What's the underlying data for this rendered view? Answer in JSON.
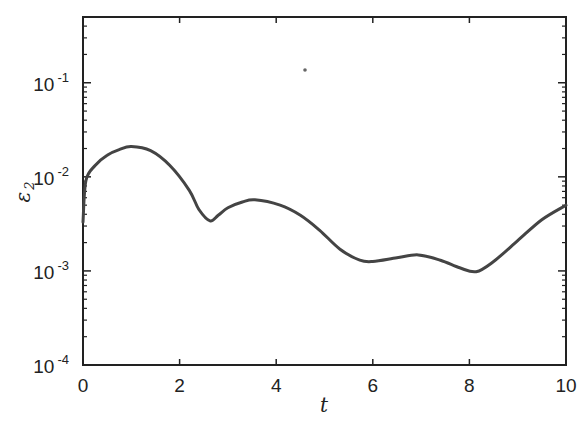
{
  "chart_data": {
    "type": "line",
    "title": "",
    "xlabel": "t",
    "ylabel": "ε",
    "ylabel_subscript": "2",
    "xscale": "linear",
    "yscale": "log",
    "xlim": [
      0,
      10
    ],
    "ylim": [
      0.0001,
      0.5
    ],
    "grid": false,
    "legend": null,
    "x_ticks": [
      0,
      2,
      4,
      6,
      8,
      10
    ],
    "x_tick_labels": [
      "0",
      "2",
      "4",
      "6",
      "8",
      "10"
    ],
    "y_ticks": [
      0.0001,
      0.001,
      0.01,
      0.1
    ],
    "y_tick_labels": [
      {
        "base": "10",
        "exp": "-4"
      },
      {
        "base": "10",
        "exp": "-3"
      },
      {
        "base": "10",
        "exp": "-2"
      },
      {
        "base": "10",
        "exp": "-1"
      }
    ],
    "line_color": "#444444",
    "series": [
      {
        "name": "ε2",
        "x": [
          0,
          0.06,
          0.25,
          0.5,
          0.75,
          1.0,
          1.4,
          1.8,
          2.2,
          2.4,
          2.63,
          2.8,
          3.0,
          3.3,
          3.56,
          4.08,
          4.5,
          4.9,
          5.32,
          5.73,
          6.0,
          6.5,
          6.94,
          7.4,
          7.8,
          8.14,
          8.5,
          9.0,
          9.5,
          10.0
        ],
        "values": [
          0.0033,
          0.0091,
          0.0132,
          0.017,
          0.0195,
          0.021,
          0.019,
          0.0132,
          0.0072,
          0.0045,
          0.0034,
          0.0039,
          0.0047,
          0.0054,
          0.0057,
          0.005,
          0.0039,
          0.0027,
          0.0017,
          0.0013,
          0.00126,
          0.00138,
          0.00148,
          0.0013,
          0.00108,
          0.00098,
          0.00126,
          0.0021,
          0.0035,
          0.005
        ]
      }
    ]
  }
}
